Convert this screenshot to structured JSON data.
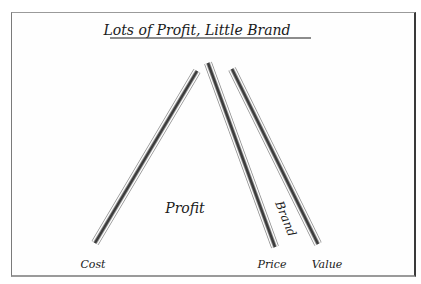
{
  "title": "Lots of Profit, Little Brand",
  "labels": {
    "cost": "Cost",
    "price": "Price",
    "value": "Value",
    "profit": "Profit",
    "brand": "Brand"
  },
  "bars": [
    {
      "name": "cost-bar",
      "x1": 95,
      "y1": 243,
      "x2": 197,
      "y2": 71
    },
    {
      "name": "price-bar",
      "x1": 208,
      "y1": 63,
      "x2": 275,
      "y2": 247
    },
    {
      "name": "value-bar",
      "x1": 232,
      "y1": 69,
      "x2": 318,
      "y2": 244
    }
  ],
  "colors": {
    "ink": "#1a1a1a",
    "bar_core": "#3c3c3c",
    "bar_edge": "#8a8a8a"
  }
}
